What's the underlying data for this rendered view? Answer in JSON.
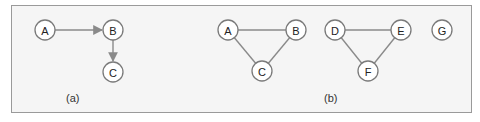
{
  "diagram": {
    "panels": [
      {
        "caption": "(a)",
        "caption_pos": [
          66,
          102
        ],
        "directed": true,
        "nodes": [
          {
            "id": "A",
            "label": "A",
            "x": 45,
            "y": 30
          },
          {
            "id": "B",
            "label": "B",
            "x": 113,
            "y": 30
          },
          {
            "id": "C",
            "label": "C",
            "x": 113,
            "y": 72
          }
        ],
        "edges": [
          {
            "from": "A",
            "to": "B"
          },
          {
            "from": "B",
            "to": "C"
          }
        ]
      },
      {
        "caption": "(b)",
        "caption_pos": [
          324,
          102
        ],
        "directed": false,
        "nodes": [
          {
            "id": "A",
            "label": "A",
            "x": 228,
            "y": 30
          },
          {
            "id": "B",
            "label": "B",
            "x": 296,
            "y": 30
          },
          {
            "id": "C",
            "label": "C",
            "x": 262,
            "y": 71
          },
          {
            "id": "D",
            "label": "D",
            "x": 335,
            "y": 30
          },
          {
            "id": "E",
            "label": "E",
            "x": 401,
            "y": 30
          },
          {
            "id": "F",
            "label": "F",
            "x": 368,
            "y": 71
          },
          {
            "id": "G",
            "label": "G",
            "x": 442,
            "y": 30
          }
        ],
        "edges": [
          {
            "from": "A",
            "to": "B"
          },
          {
            "from": "A",
            "to": "C"
          },
          {
            "from": "B",
            "to": "C"
          },
          {
            "from": "D",
            "to": "E"
          },
          {
            "from": "D",
            "to": "F"
          },
          {
            "from": "E",
            "to": "F"
          }
        ]
      }
    ],
    "node_radius": 10,
    "colors": {
      "frame_border": "#9a9a9a",
      "frame_fill": "#f5f5f5",
      "edge": "#8a8a8a",
      "node_stroke": "#7a7a7a"
    }
  }
}
